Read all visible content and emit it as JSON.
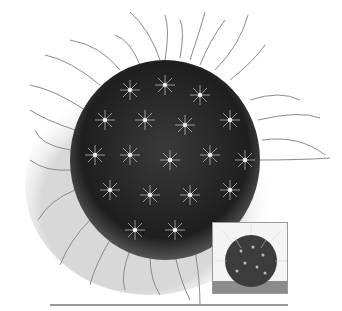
{
  "image": {
    "subject": "cactus",
    "style": "grayscale photograph",
    "main_view": "top-down close-up of globular spiny cactus",
    "inset_view": "side view of cactus in pot",
    "colors": {
      "background": "#ffffff",
      "body": "#2a2a2a",
      "spines": "#e8e8e8",
      "hair_spines": "#8a8a8a",
      "inset_border": "#999999",
      "inset_ground": "#8c8c8c",
      "ground_line": "#9a9a9a"
    }
  }
}
